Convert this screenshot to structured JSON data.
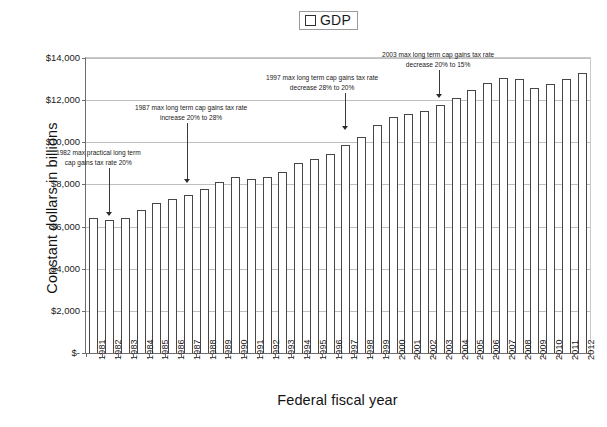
{
  "legend": {
    "entries": [
      {
        "label": "GDP",
        "marker": "white-square",
        "color": "#ffffff"
      }
    ]
  },
  "axes": {
    "y_title": "Constant dollars in billions",
    "x_title": "Federal fiscal year"
  },
  "chart_data": {
    "type": "bar",
    "title": "",
    "subtitle": "",
    "xlabel": "Federal fiscal year",
    "ylabel": "Constant dollars in billions",
    "ylim": [
      0,
      14000
    ],
    "ytick_labels": [
      "$14,000",
      "$12,000",
      "$10,000",
      "$8,000",
      "$6,000",
      "$4,000",
      "$2,000",
      "$-"
    ],
    "ytick_values": [
      14000,
      12000,
      10000,
      8000,
      6000,
      4000,
      2000,
      0
    ],
    "grid": true,
    "legend_position": "top-center",
    "series_name": "GDP",
    "bar_fill": "#ffffff",
    "bar_border": "#464646",
    "categories": [
      "1981",
      "1982",
      "1983",
      "1984",
      "1985",
      "1986",
      "1987",
      "1988",
      "1989",
      "1990",
      "1991",
      "1992",
      "1993",
      "1994",
      "1995",
      "1996",
      "1997",
      "1998",
      "1999",
      "2000",
      "2001",
      "2002",
      "2003",
      "2004",
      "2005",
      "2006",
      "2007",
      "2008",
      "2009",
      "2010",
      "2011",
      "2012"
    ],
    "values": [
      6400,
      6300,
      6400,
      6800,
      7100,
      7300,
      7500,
      7800,
      8100,
      8350,
      8250,
      8350,
      8600,
      9000,
      9200,
      9450,
      9850,
      10250,
      10800,
      11200,
      11350,
      11500,
      11750,
      12100,
      12500,
      12800,
      13050,
      13000,
      12600,
      12750,
      13000,
      13300
    ],
    "annotations": [
      {
        "id": "a1982",
        "line1": "1982 max practical long term",
        "line2": "cap gains tax rate 20%",
        "target_category": "1982"
      },
      {
        "id": "a1987",
        "line1": "1987 max long term cap gains tax rate",
        "line2": "increase 20% to 28%",
        "target_category": "1987"
      },
      {
        "id": "a1997",
        "line1": "1997 max long term cap gains tax rate",
        "line2": "decrease 28% to 20%",
        "target_category": "1997"
      },
      {
        "id": "a2003",
        "line1": "2003 max long term cap gains tax rate",
        "line2": "decrease 20% to 15%",
        "target_category": "2003"
      }
    ]
  }
}
